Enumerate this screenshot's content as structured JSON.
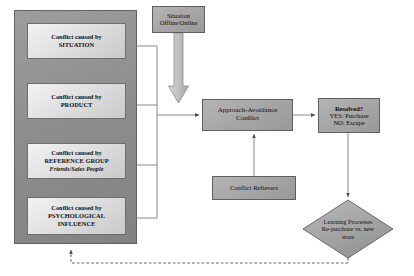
{
  "diagram": {
    "colors": {
      "panel_fill": "#8e8e8e",
      "inner_box_fill": "#e2e2e2",
      "gray_box_fill": "#a6a6a6",
      "diamond_fill": "#a6a6a6",
      "line": "#7a7a7a",
      "arrow": "#555555",
      "text": "#000000"
    },
    "panel": {
      "name": "conflict-causes-panel",
      "boxes": [
        {
          "line1": "Conflict caused by",
          "line2": "SITUATION",
          "line3": ""
        },
        {
          "line1": "Conflict caused by",
          "line2": "PRODUCT",
          "line3": ""
        },
        {
          "line1": "Conflict caused by",
          "line2": "REFERENCE GROUP",
          "line3": "Friends/Sales People"
        },
        {
          "line1": "Conflict caused by",
          "line2": "PSYCHOLOGICAL",
          "line3": "INFLUENCE"
        }
      ]
    },
    "nodes": {
      "situation": {
        "line1": "Situation",
        "line2": "Offline/Online"
      },
      "approach": {
        "line1": "Approach-Avoidance",
        "line2": "Conflict"
      },
      "resolved": {
        "line1": "Resolved?",
        "line2": "YES: Purchase",
        "line3": "NO: Escape"
      },
      "relievers": {
        "line1": "Conflict Relievers"
      },
      "learning": {
        "line1": "Learning Processes",
        "line2": "Re-purchase vs. new",
        "line3": "store"
      }
    },
    "connectors": {
      "bus_note": "four cause boxes join a vertical bus into Approach-Avoidance Conflict",
      "block_arrow_note": "hollow block arrow from Situation Offline/Online pointing down",
      "feedback_note": "dashed feedback loop from Learning Processes back to causes panel"
    }
  }
}
